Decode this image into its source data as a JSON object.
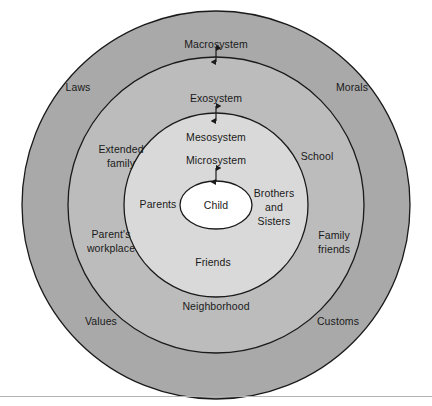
{
  "figure": {
    "colors": {
      "macrosystem_fill": "#a9a9a9",
      "exosystem_fill": "#bcbcbc",
      "mesosystem_fill": "#d4d4d4",
      "microsystem_fill": "#dcdcdc",
      "child_fill": "#ffffff",
      "stroke": "#1a1a1a",
      "text": "#1a1a1a",
      "baseline_rule": "#b4b4b4"
    }
  },
  "systems": {
    "macrosystem": "Macrosystem",
    "exosystem": "Exosystem",
    "mesosystem": "Mesosystem",
    "microsystem": "Microsystem",
    "child": "Child"
  },
  "macrosystem_items": [
    {
      "label": "Laws"
    },
    {
      "label": "Morals"
    },
    {
      "label": "Values"
    },
    {
      "label": "Customs"
    }
  ],
  "exosystem_items": [
    {
      "label": "Extended\nfamily",
      "line1": "Extended",
      "line2": "family"
    },
    {
      "label": "School",
      "line1": "School",
      "line2": ""
    },
    {
      "label": "Parent's\nworkplace",
      "line1": "Parent's",
      "line2": "workplace"
    },
    {
      "label": "Family\nfriends",
      "line1": "Family",
      "line2": "friends"
    },
    {
      "label": "Neighborhood",
      "line1": "Neighborhood",
      "line2": ""
    }
  ],
  "microsystem_items": [
    {
      "label": "Parents",
      "line1": "Parents",
      "line2": "",
      "line3": ""
    },
    {
      "label": "Brothers and Sisters",
      "line1": "Brothers",
      "line2": "and",
      "line3": "Sisters"
    },
    {
      "label": "Friends",
      "line1": "Friends",
      "line2": "",
      "line3": ""
    }
  ],
  "connectors": [
    {
      "name": "macrosystem-exosystem-arrow",
      "glyph": "double-headed-arrow"
    },
    {
      "name": "exosystem-mesosystem-arrow",
      "glyph": "double-headed-arrow"
    },
    {
      "name": "microsystem-child-arrow",
      "glyph": "double-headed-arrow"
    }
  ]
}
